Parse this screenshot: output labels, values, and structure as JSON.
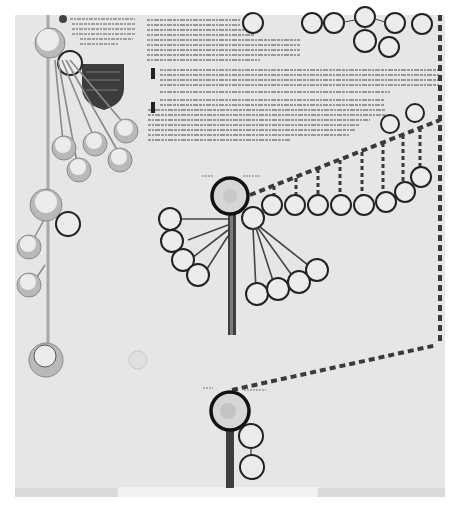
{
  "document": {
    "type": "genealogical roll manuscript",
    "colors": {
      "paper": "#e6e6e4",
      "ink": "#2a2a2a",
      "line_gray": "#9a9a9a",
      "roundel_fill": "#b9b9b7",
      "roundel_inner": "#ececea",
      "shield": "#3c3c3c",
      "dash_light": "#cfcfcf"
    },
    "text_blocks": [
      {
        "id": "top-left-note",
        "x": 60,
        "y": 15,
        "w": 80,
        "h": 35,
        "lines": 7
      },
      {
        "id": "top-main-text",
        "x": 145,
        "y": 15,
        "w": 150,
        "h": 55,
        "lines": 10
      },
      {
        "id": "mid-main-text-1",
        "x": 150,
        "y": 65,
        "w": 295,
        "h": 30,
        "lines": 6
      },
      {
        "id": "mid-main-text-2",
        "x": 150,
        "y": 95,
        "w": 240,
        "h": 48,
        "lines": 9
      }
    ],
    "initials": [
      "I",
      "I"
    ],
    "footer_caption": "",
    "roundels": {
      "left_line": 6,
      "central_figure_children": 10,
      "diagonal_row": 8,
      "top_right_cluster": 6
    }
  }
}
